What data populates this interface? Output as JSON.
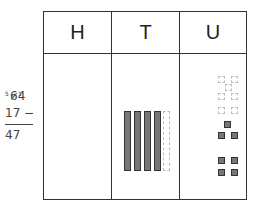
{
  "headers": {
    "h": "H",
    "t": "T",
    "u": "U"
  },
  "sum": {
    "top_tens_crossed": "6",
    "top_tens_regroup": "5",
    "top_units_regroup": "1",
    "top_units": "4",
    "subtrahend": "17 −",
    "result": "47"
  },
  "model": {
    "tens_total": 5,
    "tens_removed": 1,
    "units_total": 14,
    "units_removed": 7
  }
}
